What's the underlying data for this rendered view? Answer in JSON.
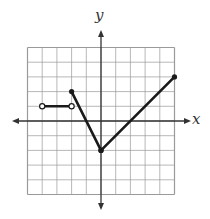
{
  "graph": {
    "x_label": "x",
    "y_label": "y",
    "x_range": [
      -5,
      5
    ],
    "y_range": [
      -5,
      5
    ],
    "grid_step": 1,
    "colors": {
      "grid": "#9a9a9a",
      "axis": "#333333",
      "curve": "#1a1a1a"
    },
    "segments": [
      {
        "from": [
          -4,
          1
        ],
        "to": [
          -2,
          1
        ],
        "start_marker": "open",
        "end_marker": "open"
      },
      {
        "from": [
          -2,
          2
        ],
        "to": [
          0,
          -2
        ],
        "start_marker": "closed",
        "end_marker": "closed"
      },
      {
        "from": [
          0,
          -2
        ],
        "to": [
          5,
          3
        ],
        "start_marker": "closed",
        "end_marker": "closed"
      }
    ]
  },
  "chart_data": {
    "type": "line",
    "title": "",
    "xlabel": "x",
    "ylabel": "y",
    "xlim": [
      -5,
      5
    ],
    "ylim": [
      -5,
      5
    ],
    "grid": true,
    "series": [
      {
        "name": "piece-1 (open endpoints)",
        "x": [
          -4,
          -2
        ],
        "y": [
          1,
          1
        ]
      },
      {
        "name": "piece-2",
        "x": [
          -2,
          0
        ],
        "y": [
          2,
          -2
        ]
      },
      {
        "name": "piece-3",
        "x": [
          0,
          5
        ],
        "y": [
          -2,
          3
        ]
      }
    ],
    "points": [
      {
        "x": -4,
        "y": 1,
        "style": "open"
      },
      {
        "x": -2,
        "y": 1,
        "style": "open"
      },
      {
        "x": -2,
        "y": 2,
        "style": "closed"
      },
      {
        "x": 0,
        "y": -2,
        "style": "closed"
      },
      {
        "x": 5,
        "y": 3,
        "style": "closed"
      }
    ]
  }
}
